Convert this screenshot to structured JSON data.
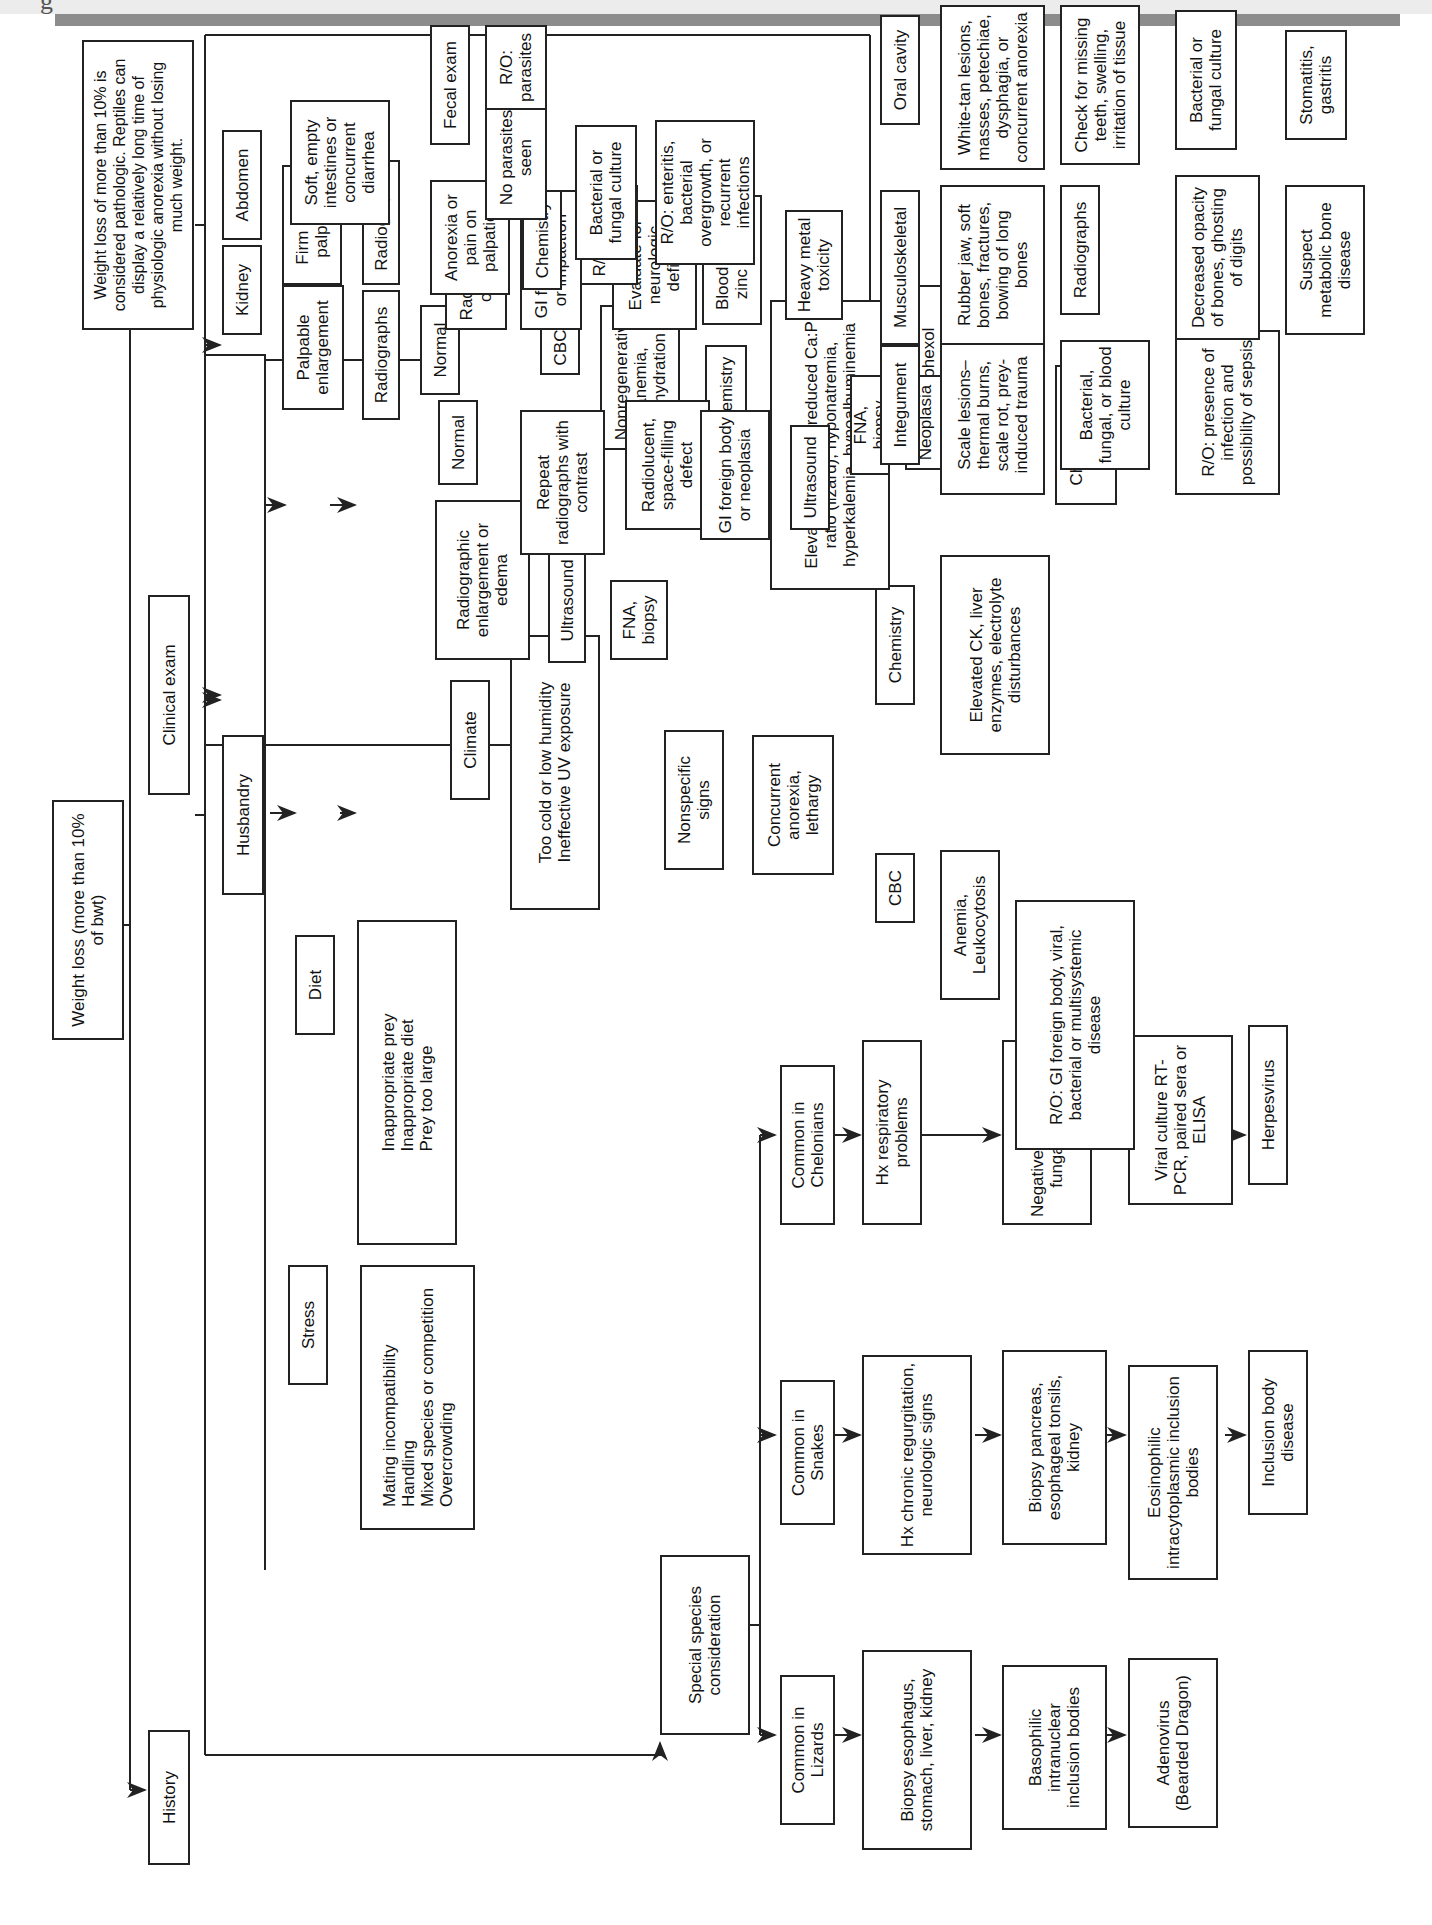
{
  "root": "Weight loss (more than 10% of bwt)",
  "note": "Weight loss of more than 10% is considered pathologic. Reptiles can display a relatively long time of physiologic anorexia without losing much weight.",
  "branches": {
    "history": "History",
    "clinical_exam": "Clinical exam"
  },
  "history": {
    "husbandry": "Husbandry",
    "stress": "Stress",
    "stress_items": "Mating incompatibility\nHandling\nMixed species or competition\nOvercrowding",
    "diet": "Diet",
    "diet_items": "Inappropriate prey\nInappropriate diet\nPrey too large",
    "climate": "Climate",
    "climate_items": "Too cold or low humidity\nIneffective UV exposure",
    "special": "Special species consideration",
    "lizards": [
      "Common in Lizards",
      "Biopsy esophagus, stomach, liver, kidney",
      "Basophilic intranuclear inclusion bodies",
      "Adenovirus (Bearded Dragon)"
    ],
    "snakes": [
      "Common in Snakes",
      "Hx chronic regurgitation, neurologic signs",
      "Biopsy pancreas, esophageal tonsils, kidney",
      "Eosinophilic intracytoplasmic inclusion bodies",
      "Inclusion body disease"
    ],
    "chelonians": [
      "Common in Chelonians",
      "Hx respiratory problems",
      "Negative bacterial and fungal cultures",
      "Viral culture RT-PCR, paired sera or ELISA",
      "Herpesvirus"
    ]
  },
  "clinical": {
    "nonspecific": "Nonspecific signs",
    "concurrent": "Concurrent anorexia, lethargy",
    "cbc": "CBC",
    "anemia": "Anemia, Leukocytosis",
    "ro_gi": "R/O: GI foreign body, viral, bacterial or multisystemic disease",
    "chemistry": "Chemistry",
    "elevated_ck": "Elevated CK, liver enzymes, electrolyte disturbances",
    "kidney": {
      "kidney": "Kidney",
      "palpable": "Palpable enlargement",
      "radiographs": "Radiographs",
      "normal": "Normal",
      "radiographic_enl": "Radiographic enlargement or edema",
      "ultrasound": "Ultrasound",
      "fna": "FNA, biopsy",
      "cbc": "CBC",
      "nonregen": "Nonregenerative anemia, dehydration",
      "chemistry": "Chemistry",
      "elevated": "Elevated uric acid, reduced Ca:P ratio (lizard), hyponatremia, hyperkalemia, hypoalbuminemia",
      "iohexol": "Iohexol clearance",
      "decreased": "Decreased",
      "crf": "Chronic renal failure"
    },
    "abdomen": {
      "abdomen": "Abdomen",
      "firm": "Firm mass palpated",
      "radiographs": "Radiographs",
      "normal": "Normal",
      "repeat": "Repeat radiographs with contrast",
      "radiolucent": "Radiolucent, space-filling defect",
      "gi_neo": "GI foreign body or neoplasia",
      "ultrasound": "Ultrasound",
      "fna": "FNA, biopsy",
      "neoplasia": "Neoplasia",
      "radiodense": "Radiodense opacity",
      "gi_impaction": "GI foreign body or impaction",
      "neuro": "Evaluate for neurologic deficits",
      "lead": "Blood lead or zinc levels",
      "heavy": "Heavy metal toxicity",
      "soft": "Soft, empty intestines or concurrent diarrhea",
      "anorexia_pain": "Anorexia or pain on palpation",
      "chemistry": "Chemistry",
      "organ": "R/O: organ failure",
      "fecal": "Fecal exam",
      "no_parasites": "No parasites seen",
      "ro_parasites": "R/O: parasites",
      "culture": "Bacterial or fungal culture",
      "ro_enteritis": "R/O: enteritis, bacterial overgrowth, or recurrent infections"
    },
    "integument": [
      "Integument",
      "Scale lesions–thermal burns, scale rot, prey-induced trauma",
      "Bacterial, fungal, or blood culture",
      "R/O: presence of infection and possibility of sepsis"
    ],
    "musculoskeletal": [
      "Musculoskeletal",
      "Rubber jaw, soft bones, fractures, bowing of long bones",
      "Radiographs",
      "Decreased opacity of bones, ghosting of digits",
      "Suspect metabolic bone disease"
    ],
    "oral": [
      "Oral cavity",
      "White-tan lesions, masses, petechiae, dysphagia, or concurrent anorexia",
      "Check for missing teeth, swelling, irritation of tissue",
      "Bacterial or fungal culture",
      "Stomatitis, gastritis"
    ]
  }
}
